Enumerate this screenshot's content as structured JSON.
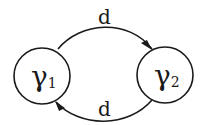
{
  "diagram": {
    "nodes": [
      {
        "id": "gamma1",
        "label": "γ",
        "subscript": "1"
      },
      {
        "id": "gamma2",
        "label": "γ",
        "subscript": "2"
      }
    ],
    "edges": [
      {
        "from": "gamma1",
        "to": "gamma2",
        "label": "d",
        "position": "top"
      },
      {
        "from": "gamma2",
        "to": "gamma1",
        "label": "d",
        "position": "bottom"
      }
    ],
    "colors": {
      "stroke": "#1a1a1a",
      "background": "#ffffff"
    }
  }
}
